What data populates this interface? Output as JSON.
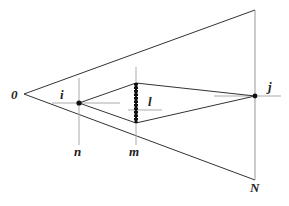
{
  "diagram": {
    "type": "optics-ray-diagram",
    "labels": {
      "origin": "0",
      "i": "i",
      "l": "l",
      "j": "j",
      "n": "n",
      "m": "m",
      "N": "N"
    },
    "colors": {
      "line": "#333333",
      "guide": "#aaaaaa",
      "point": "#111111"
    }
  }
}
